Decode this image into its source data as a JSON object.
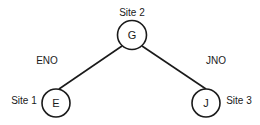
{
  "diagram": {
    "nodes": [
      {
        "id": "G",
        "label": "G",
        "site": "Site 2"
      },
      {
        "id": "E",
        "label": "E",
        "site": "Site 1"
      },
      {
        "id": "J",
        "label": "J",
        "site": "Site 3"
      }
    ],
    "edges": [
      {
        "from": "G",
        "to": "E",
        "label": "ENO"
      },
      {
        "from": "G",
        "to": "J",
        "label": "JNO"
      }
    ]
  }
}
